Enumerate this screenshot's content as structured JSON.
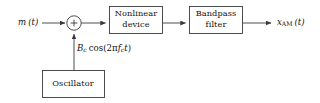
{
  "diagram": {
    "background_color": "#ffffff",
    "line_color": "#3a3a3a",
    "text_color": "#111111",
    "blocks": [
      {
        "id": "nonlinear",
        "line1": "Nonlinear",
        "line2": "device"
      },
      {
        "id": "bandpass",
        "line1": "Bandpass",
        "line2": "filter"
      },
      {
        "id": "oscillator",
        "line1": "Oscillator",
        "line2": ""
      }
    ],
    "summing_junction": {
      "sign": "+"
    },
    "signals": {
      "input": {
        "base": "m",
        "arg": "(t)"
      },
      "carrier": {
        "amplitude_base": "B",
        "amplitude_sub": "c",
        "function": "cos",
        "arg_open": "(2",
        "pi": "π",
        "freq_base": "f",
        "freq_sub": "c",
        "time": "t",
        "arg_close": ")"
      },
      "output": {
        "base": "x",
        "sub": "AM",
        "arg": "(t)"
      }
    }
  }
}
